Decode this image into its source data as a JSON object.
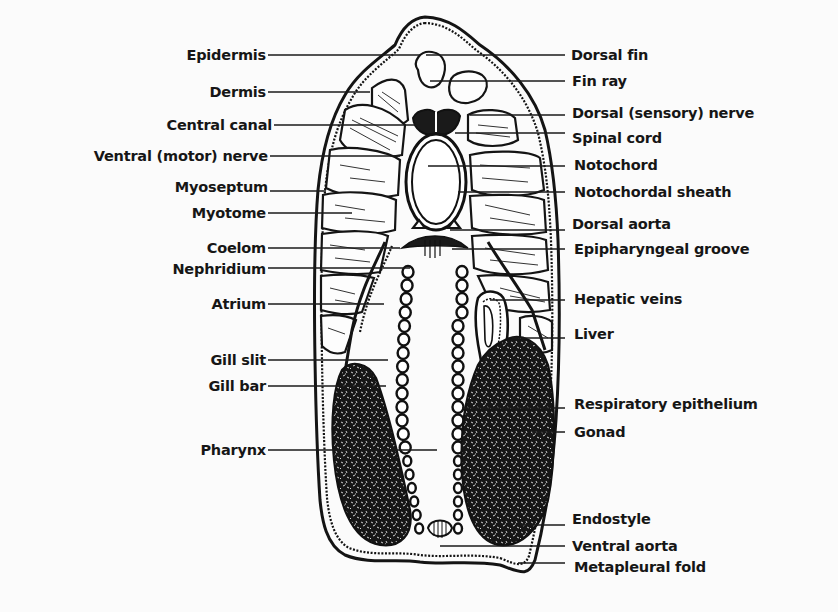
{
  "diagram": {
    "labels_left": [
      {
        "id": "epidermis",
        "text": "Epidermis"
      },
      {
        "id": "dermis",
        "text": "Dermis"
      },
      {
        "id": "central-canal",
        "text": "Central canal"
      },
      {
        "id": "ventral-motor-nerve",
        "text": "Ventral (motor) nerve"
      },
      {
        "id": "myoseptum",
        "text": "Myoseptum"
      },
      {
        "id": "myotome",
        "text": "Myotome"
      },
      {
        "id": "coelom",
        "text": "Coelom"
      },
      {
        "id": "nephridium",
        "text": "Nephridium"
      },
      {
        "id": "atrium",
        "text": "Atrium"
      },
      {
        "id": "gill-slit",
        "text": "Gill slit"
      },
      {
        "id": "gill-bar",
        "text": "Gill bar"
      },
      {
        "id": "pharynx",
        "text": "Pharynx"
      }
    ],
    "labels_right": [
      {
        "id": "dorsal-fin",
        "text": "Dorsal fin"
      },
      {
        "id": "fin-ray",
        "text": "Fin ray"
      },
      {
        "id": "dorsal-sensory-nerve",
        "text": "Dorsal (sensory) nerve"
      },
      {
        "id": "spinal-cord",
        "text": "Spinal cord"
      },
      {
        "id": "notochord",
        "text": "Notochord"
      },
      {
        "id": "notochordal-sheath",
        "text": "Notochordal sheath"
      },
      {
        "id": "dorsal-aorta",
        "text": "Dorsal aorta"
      },
      {
        "id": "epipharyngeal-groove",
        "text": "Epipharyngeal groove"
      },
      {
        "id": "hepatic-veins",
        "text": "Hepatic veins"
      },
      {
        "id": "liver",
        "text": "Liver"
      },
      {
        "id": "respiratory-epithelium",
        "text": "Respiratory epithelium"
      },
      {
        "id": "gonad",
        "text": "Gonad"
      },
      {
        "id": "endostyle",
        "text": "Endostyle"
      },
      {
        "id": "ventral-aorta",
        "text": "Ventral aorta"
      },
      {
        "id": "metapleural-fold",
        "text": "Metapleural fold"
      }
    ]
  }
}
